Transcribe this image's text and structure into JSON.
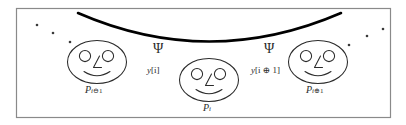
{
  "figure": {
    "border_color": "#7a7a7a",
    "stroke_color": "#2b2b2b",
    "curve_color": "#000000",
    "background": "#ffffff"
  },
  "nodes": [
    {
      "id": "node-left",
      "label_base": "P",
      "label_sub": "i⊖1",
      "label_sub_prefix": "i",
      "label_sub_op": "⊖",
      "label_sub_suffix": "1",
      "label_full": "P i⊖1"
    },
    {
      "id": "node-center",
      "label_base": "P",
      "label_sub": "i",
      "label_sub_prefix": "i",
      "label_sub_op": "",
      "label_sub_suffix": "",
      "label_full": "P i"
    },
    {
      "id": "node-right",
      "label_base": "P",
      "label_sub": "i⊕1",
      "label_sub_prefix": "i",
      "label_sub_op": "⊕",
      "label_sub_suffix": "1",
      "label_full": "P i⊕1"
    }
  ],
  "antennas": [
    {
      "id": "antenna-left",
      "glyph": "Ψ",
      "glyph_name": "psi-antenna-icon",
      "signal_base": "y",
      "signal_index": "[i]",
      "signal_full": "y[i]"
    },
    {
      "id": "antenna-right",
      "glyph": "Ψ",
      "glyph_name": "psi-antenna-icon",
      "signal_base": "y",
      "signal_index": "[i ⊕ 1]",
      "signal_full": "y[i ⊕ 1]"
    }
  ],
  "decor": {
    "dots_left_count": 3,
    "dots_right_count": 3,
    "curve_description": "thick downward-bowed arc spanning the upper area"
  }
}
